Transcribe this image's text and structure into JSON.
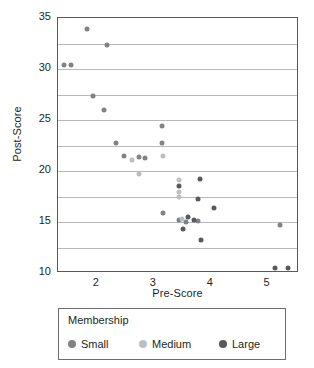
{
  "chart_data": {
    "type": "scatter",
    "title": "",
    "xlabel": "Pre-Score",
    "ylabel": "Post-Score",
    "xlim": [
      1.32,
      5.55
    ],
    "ylim": [
      10,
      35
    ],
    "xticks": [
      2,
      3,
      4,
      5
    ],
    "yticks": [
      10,
      15,
      20,
      25,
      30,
      35
    ],
    "gridlines_y": [
      12.5,
      15,
      17.5,
      20,
      22.5,
      25,
      27.5,
      30,
      32.5
    ],
    "grid": "horizontal-minor",
    "legend": {
      "title": "Membership",
      "position": "below-axes",
      "entries": [
        {
          "name": "Small",
          "color": "#808285"
        },
        {
          "name": "Medium",
          "color": "#bcbec0"
        },
        {
          "name": "Large",
          "color": "#58595b"
        }
      ]
    },
    "series": [
      {
        "name": "Small",
        "color": "#808285",
        "points": [
          {
            "x": 1.42,
            "y": 30.4
          },
          {
            "x": 1.54,
            "y": 30.4
          },
          {
            "x": 1.83,
            "y": 33.9
          },
          {
            "x": 1.93,
            "y": 27.4
          },
          {
            "x": 2.12,
            "y": 26.0
          },
          {
            "x": 2.18,
            "y": 32.4
          },
          {
            "x": 2.33,
            "y": 22.7
          },
          {
            "x": 2.48,
            "y": 21.5
          },
          {
            "x": 2.75,
            "y": 21.4
          },
          {
            "x": 2.85,
            "y": 21.3
          },
          {
            "x": 3.15,
            "y": 24.4
          },
          {
            "x": 3.15,
            "y": 22.7
          },
          {
            "x": 3.17,
            "y": 15.9
          },
          {
            "x": 3.45,
            "y": 15.2
          },
          {
            "x": 3.56,
            "y": 15.0
          },
          {
            "x": 3.78,
            "y": 15.1
          },
          {
            "x": 5.22,
            "y": 14.7
          }
        ]
      },
      {
        "name": "Medium",
        "color": "#bcbec0",
        "points": [
          {
            "x": 2.62,
            "y": 21.1
          },
          {
            "x": 2.74,
            "y": 19.7
          },
          {
            "x": 3.16,
            "y": 21.5
          },
          {
            "x": 3.44,
            "y": 19.1
          },
          {
            "x": 3.44,
            "y": 17.9
          },
          {
            "x": 3.45,
            "y": 17.5
          },
          {
            "x": 3.5,
            "y": 15.3
          }
        ]
      },
      {
        "name": "Large",
        "color": "#58595b",
        "points": [
          {
            "x": 3.44,
            "y": 18.5
          },
          {
            "x": 3.52,
            "y": 14.3
          },
          {
            "x": 3.6,
            "y": 15.5
          },
          {
            "x": 3.7,
            "y": 15.2
          },
          {
            "x": 3.77,
            "y": 17.3
          },
          {
            "x": 3.82,
            "y": 19.2
          },
          {
            "x": 3.83,
            "y": 13.2
          },
          {
            "x": 4.05,
            "y": 16.4
          },
          {
            "x": 5.12,
            "y": 10.5
          },
          {
            "x": 5.36,
            "y": 10.5
          }
        ]
      }
    ]
  }
}
